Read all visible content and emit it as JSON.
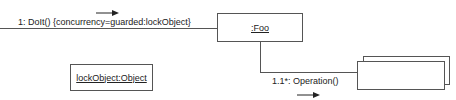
{
  "diagram": {
    "type": "UML collaboration diagram",
    "message_in": {
      "label": "1: DoIt() {concurrency=guarded:lockObject}",
      "direction_icon": "arrow-right-icon"
    },
    "objects": {
      "foo": {
        "label": ":Foo"
      },
      "lock": {
        "label": "lockObject:Object"
      },
      "multi": {
        "label": ""
      }
    },
    "message_out": {
      "label": "1.1*: Operation()",
      "direction_icon": "arrow-right-icon"
    }
  }
}
